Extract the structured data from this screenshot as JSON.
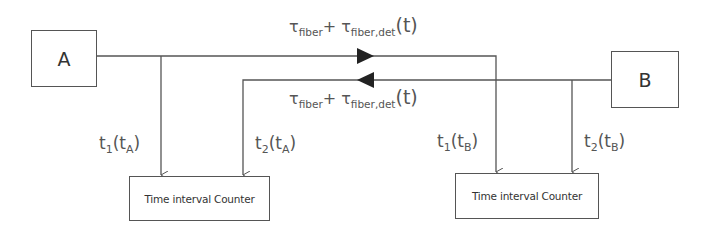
{
  "nodes": {
    "a": {
      "label": "A"
    },
    "b": {
      "label": "B"
    }
  },
  "counters": [
    {
      "label": "Time interval Counter"
    },
    {
      "label": "Time interval Counter"
    }
  ],
  "links": {
    "forward": {
      "tau": "τ",
      "sub1": "fiber",
      "plus": "+",
      "tau2": "τ",
      "sub2": "fiber,det",
      "arg": "(t)",
      "direction": "A→B"
    },
    "backward": {
      "tau": "τ",
      "sub1": "fiber",
      "plus": "+",
      "tau2": "τ",
      "sub2": "fiber,det",
      "arg": "(t)",
      "direction": "B→A"
    }
  },
  "timestamps": [
    {
      "t": "t",
      "idx": "1",
      "open": "(t",
      "src": "A",
      "close": ")"
    },
    {
      "t": "t",
      "idx": "2",
      "open": "(t",
      "src": "A",
      "close": ")"
    },
    {
      "t": "t",
      "idx": "1",
      "open": "(t",
      "src": "B",
      "close": ")"
    },
    {
      "t": "t",
      "idx": "2",
      "open": "(t",
      "src": "B",
      "close": ")"
    }
  ],
  "colors": {
    "line": "#555555",
    "text": "#555555",
    "background": "#ffffff"
  }
}
